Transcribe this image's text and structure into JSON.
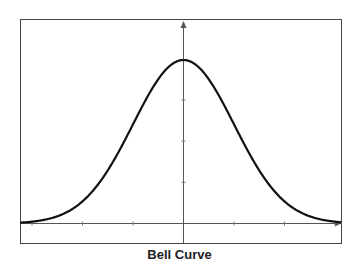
{
  "chart_data": {
    "type": "line",
    "title": "Bell Curve",
    "xlabel": "",
    "ylabel": "",
    "series": [
      {
        "name": "Normal distribution",
        "function": "exp(-x^2/2)",
        "mean": 0,
        "std": 1
      }
    ],
    "x_ticks": [
      -3,
      -2,
      -1,
      0,
      1,
      2,
      3
    ],
    "y_ticks": [
      0.25,
      0.5,
      0.75,
      1.0
    ],
    "xlim": [
      -3.2,
      3.2
    ],
    "ylim": [
      -0.3,
      1.3
    ],
    "tick_labels_shown": false,
    "grid": false,
    "legend": null
  },
  "caption": "Bell Curve",
  "colors": {
    "frame": "#444444",
    "axes": "#555555",
    "curve": "#111111"
  }
}
